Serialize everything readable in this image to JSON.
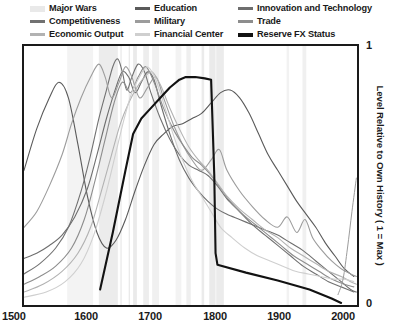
{
  "legend": {
    "items": [
      {
        "label": "Major Wars",
        "color": "#e9e9e9",
        "style": "band",
        "name": "legend-item-major-wars"
      },
      {
        "label": "Education",
        "color": "#5a5a5a",
        "style": "line",
        "name": "legend-item-education"
      },
      {
        "label": "Innovation and Technology",
        "color": "#6e6e6e",
        "style": "line",
        "name": "legend-item-innovation-and-technology"
      },
      {
        "label": "Competitiveness",
        "color": "#717171",
        "style": "line",
        "name": "legend-item-competitiveness"
      },
      {
        "label": "Military",
        "color": "#9c9c9c",
        "style": "line",
        "name": "legend-item-military"
      },
      {
        "label": "Trade",
        "color": "#8d8d8d",
        "style": "line",
        "name": "legend-item-trade"
      },
      {
        "label": "Economic Output",
        "color": "#b2b2b2",
        "style": "line",
        "name": "legend-item-economic-output"
      },
      {
        "label": "Financial Center",
        "color": "#cfcfcf",
        "style": "line",
        "name": "legend-item-financial-center"
      },
      {
        "label": "Reserve FX Status",
        "color": "#121212",
        "style": "thick",
        "name": "legend-item-reserve-fx-status"
      }
    ]
  },
  "axes": {
    "x_ticks": [
      "1500",
      "1600",
      "1700",
      "1800",
      "1900",
      "2000"
    ],
    "y_ticks": {
      "top": "1",
      "bottom": "0"
    },
    "y_title": "Level Relative to Own History ( 1 = Max )"
  },
  "chart_data": {
    "type": "line",
    "title": "",
    "xlabel": "",
    "ylabel": "Level Relative to Own History ( 1 = Max )",
    "xlim": [
      1500,
      2025
    ],
    "ylim": [
      0,
      1
    ],
    "grid": false,
    "legend_position": "top",
    "x_tick_values": [
      1500,
      1600,
      1700,
      1800,
      1900,
      2000
    ],
    "y_tick_values": [
      0,
      1
    ],
    "shaded_bands": {
      "name": "Major Wars",
      "color": "#e9e9e9",
      "intervals": [
        [
          1568,
          1609,
          0.55
        ],
        [
          1618,
          1648,
          0.85
        ],
        [
          1652,
          1654,
          1.0
        ],
        [
          1665,
          1667,
          1.0
        ],
        [
          1672,
          1678,
          0.95
        ],
        [
          1688,
          1697,
          0.8
        ],
        [
          1702,
          1713,
          0.7
        ],
        [
          1739,
          1748,
          0.55
        ],
        [
          1756,
          1763,
          0.75
        ],
        [
          1780,
          1784,
          0.9
        ],
        [
          1792,
          1802,
          0.95
        ],
        [
          1803,
          1815,
          0.9
        ],
        [
          1914,
          1918,
          0.6
        ],
        [
          1939,
          1945,
          0.7
        ]
      ]
    },
    "series": [
      {
        "name": "Major Wars",
        "color": "#e9e9e9",
        "width": 1.0,
        "is_band": true,
        "points": []
      },
      {
        "name": "Education",
        "color": "#5a5a5a",
        "width": 1.1,
        "points": [
          [
            1500,
            0.52
          ],
          [
            1520,
            0.68
          ],
          [
            1540,
            0.8
          ],
          [
            1555,
            0.86
          ],
          [
            1570,
            0.8
          ],
          [
            1585,
            0.62
          ],
          [
            1600,
            0.42
          ],
          [
            1615,
            0.28
          ],
          [
            1630,
            0.22
          ],
          [
            1645,
            0.25
          ],
          [
            1660,
            0.33
          ],
          [
            1675,
            0.44
          ],
          [
            1690,
            0.54
          ],
          [
            1705,
            0.62
          ],
          [
            1720,
            0.66
          ],
          [
            1735,
            0.69
          ],
          [
            1750,
            0.7
          ],
          [
            1765,
            0.72
          ],
          [
            1780,
            0.74
          ],
          [
            1795,
            0.78
          ],
          [
            1810,
            0.82
          ],
          [
            1825,
            0.83
          ],
          [
            1840,
            0.8
          ],
          [
            1855,
            0.74
          ],
          [
            1870,
            0.66
          ],
          [
            1885,
            0.58
          ],
          [
            1900,
            0.52
          ],
          [
            1915,
            0.46
          ],
          [
            1930,
            0.4
          ],
          [
            1945,
            0.35
          ],
          [
            1960,
            0.3
          ],
          [
            1975,
            0.24
          ],
          [
            1990,
            0.19
          ],
          [
            2005,
            0.14
          ],
          [
            2020,
            0.11
          ]
        ]
      },
      {
        "name": "Innovation and Technology",
        "color": "#6e6e6e",
        "width": 1.1,
        "points": [
          [
            1500,
            0.18
          ],
          [
            1520,
            0.2
          ],
          [
            1540,
            0.23
          ],
          [
            1560,
            0.27
          ],
          [
            1580,
            0.34
          ],
          [
            1600,
            0.45
          ],
          [
            1615,
            0.58
          ],
          [
            1630,
            0.72
          ],
          [
            1645,
            0.84
          ],
          [
            1655,
            0.9
          ],
          [
            1665,
            0.88
          ],
          [
            1675,
            0.82
          ],
          [
            1685,
            0.86
          ],
          [
            1695,
            0.9
          ],
          [
            1705,
            0.87
          ],
          [
            1715,
            0.78
          ],
          [
            1730,
            0.66
          ],
          [
            1745,
            0.56
          ],
          [
            1760,
            0.49
          ],
          [
            1775,
            0.44
          ],
          [
            1790,
            0.4
          ],
          [
            1805,
            0.37
          ],
          [
            1820,
            0.35
          ],
          [
            1840,
            0.33
          ],
          [
            1860,
            0.31
          ],
          [
            1880,
            0.29
          ],
          [
            1900,
            0.27
          ],
          [
            1920,
            0.24
          ],
          [
            1940,
            0.21
          ],
          [
            1960,
            0.17
          ],
          [
            1980,
            0.13
          ],
          [
            2000,
            0.09
          ],
          [
            2015,
            0.06
          ],
          [
            2024,
            0.05
          ]
        ]
      },
      {
        "name": "Competitiveness",
        "color": "#717171",
        "width": 1.1,
        "points": [
          [
            1500,
            0.12
          ],
          [
            1525,
            0.16
          ],
          [
            1550,
            0.22
          ],
          [
            1570,
            0.3
          ],
          [
            1590,
            0.44
          ],
          [
            1605,
            0.58
          ],
          [
            1618,
            0.72
          ],
          [
            1630,
            0.83
          ],
          [
            1640,
            0.92
          ],
          [
            1648,
            0.95
          ],
          [
            1655,
            0.9
          ],
          [
            1662,
            0.83
          ],
          [
            1670,
            0.88
          ],
          [
            1680,
            0.93
          ],
          [
            1690,
            0.9
          ],
          [
            1700,
            0.82
          ],
          [
            1715,
            0.72
          ],
          [
            1730,
            0.64
          ],
          [
            1745,
            0.58
          ],
          [
            1760,
            0.54
          ],
          [
            1775,
            0.52
          ],
          [
            1790,
            0.5
          ],
          [
            1805,
            0.46
          ],
          [
            1820,
            0.41
          ],
          [
            1840,
            0.36
          ],
          [
            1860,
            0.31
          ],
          [
            1880,
            0.27
          ],
          [
            1900,
            0.23
          ],
          [
            1920,
            0.19
          ],
          [
            1940,
            0.15
          ],
          [
            1960,
            0.12
          ],
          [
            1980,
            0.09
          ],
          [
            2000,
            0.07
          ],
          [
            2020,
            0.05
          ]
        ]
      },
      {
        "name": "Military",
        "color": "#9c9c9c",
        "width": 1.1,
        "points": [
          [
            1500,
            0.3
          ],
          [
            1520,
            0.36
          ],
          [
            1540,
            0.46
          ],
          [
            1560,
            0.58
          ],
          [
            1575,
            0.7
          ],
          [
            1590,
            0.8
          ],
          [
            1605,
            0.88
          ],
          [
            1618,
            0.93
          ],
          [
            1628,
            0.88
          ],
          [
            1638,
            0.8
          ],
          [
            1650,
            0.86
          ],
          [
            1660,
            0.92
          ],
          [
            1670,
            0.88
          ],
          [
            1682,
            0.8
          ],
          [
            1695,
            0.84
          ],
          [
            1708,
            0.88
          ],
          [
            1720,
            0.8
          ],
          [
            1735,
            0.7
          ],
          [
            1750,
            0.62
          ],
          [
            1765,
            0.56
          ],
          [
            1780,
            0.52
          ],
          [
            1795,
            0.56
          ],
          [
            1808,
            0.6
          ],
          [
            1820,
            0.52
          ],
          [
            1840,
            0.44
          ],
          [
            1860,
            0.38
          ],
          [
            1880,
            0.33
          ],
          [
            1900,
            0.3
          ],
          [
            1915,
            0.34
          ],
          [
            1930,
            0.28
          ],
          [
            1943,
            0.33
          ],
          [
            1955,
            0.26
          ],
          [
            1970,
            0.21
          ],
          [
            1985,
            0.17
          ],
          [
            2000,
            0.14
          ],
          [
            2015,
            0.12
          ],
          [
            2024,
            0.11
          ]
        ]
      },
      {
        "name": "Trade",
        "color": "#8d8d8d",
        "width": 1.1,
        "points": [
          [
            1500,
            0.08
          ],
          [
            1525,
            0.11
          ],
          [
            1550,
            0.15
          ],
          [
            1575,
            0.22
          ],
          [
            1595,
            0.33
          ],
          [
            1612,
            0.48
          ],
          [
            1628,
            0.64
          ],
          [
            1642,
            0.78
          ],
          [
            1655,
            0.86
          ],
          [
            1668,
            0.82
          ],
          [
            1680,
            0.88
          ],
          [
            1692,
            0.92
          ],
          [
            1705,
            0.86
          ],
          [
            1720,
            0.76
          ],
          [
            1735,
            0.68
          ],
          [
            1750,
            0.62
          ],
          [
            1765,
            0.57
          ],
          [
            1780,
            0.54
          ],
          [
            1795,
            0.5
          ],
          [
            1810,
            0.45
          ],
          [
            1825,
            0.4
          ],
          [
            1845,
            0.35
          ],
          [
            1865,
            0.31
          ],
          [
            1885,
            0.27
          ],
          [
            1905,
            0.23
          ],
          [
            1925,
            0.19
          ],
          [
            1945,
            0.16
          ],
          [
            1965,
            0.13
          ],
          [
            1985,
            0.1
          ],
          [
            2005,
            0.08
          ],
          [
            2020,
            0.07
          ]
        ]
      },
      {
        "name": "Economic Output",
        "color": "#b2b2b2",
        "width": 1.1,
        "points": [
          [
            1500,
            0.05
          ],
          [
            1530,
            0.08
          ],
          [
            1560,
            0.13
          ],
          [
            1585,
            0.2
          ],
          [
            1605,
            0.3
          ],
          [
            1622,
            0.44
          ],
          [
            1638,
            0.58
          ],
          [
            1652,
            0.7
          ],
          [
            1665,
            0.78
          ],
          [
            1678,
            0.84
          ],
          [
            1690,
            0.88
          ],
          [
            1702,
            0.9
          ],
          [
            1715,
            0.85
          ],
          [
            1730,
            0.76
          ],
          [
            1745,
            0.68
          ],
          [
            1760,
            0.61
          ],
          [
            1775,
            0.56
          ],
          [
            1790,
            0.52
          ],
          [
            1805,
            0.47
          ],
          [
            1820,
            0.42
          ],
          [
            1840,
            0.37
          ],
          [
            1860,
            0.33
          ],
          [
            1880,
            0.29
          ],
          [
            1900,
            0.26
          ],
          [
            1920,
            0.22
          ],
          [
            1940,
            0.19
          ],
          [
            1960,
            0.16
          ],
          [
            1980,
            0.13
          ],
          [
            2000,
            0.11
          ],
          [
            2015,
            0.09
          ],
          [
            2024,
            0.08
          ]
        ]
      },
      {
        "name": "Financial Center",
        "color": "#cfcfcf",
        "width": 1.1,
        "points": [
          [
            1500,
            0.03
          ],
          [
            1535,
            0.05
          ],
          [
            1565,
            0.09
          ],
          [
            1590,
            0.16
          ],
          [
            1610,
            0.27
          ],
          [
            1628,
            0.42
          ],
          [
            1644,
            0.58
          ],
          [
            1658,
            0.72
          ],
          [
            1670,
            0.82
          ],
          [
            1682,
            0.88
          ],
          [
            1694,
            0.92
          ],
          [
            1706,
            0.88
          ],
          [
            1720,
            0.78
          ],
          [
            1735,
            0.66
          ],
          [
            1750,
            0.56
          ],
          [
            1765,
            0.48
          ],
          [
            1780,
            0.42
          ],
          [
            1795,
            0.36
          ],
          [
            1810,
            0.3
          ],
          [
            1828,
            0.26
          ],
          [
            1848,
            0.22
          ],
          [
            1868,
            0.19
          ],
          [
            1888,
            0.17
          ],
          [
            1908,
            0.15
          ],
          [
            1928,
            0.13
          ],
          [
            1948,
            0.12
          ],
          [
            1968,
            0.11
          ],
          [
            1988,
            0.1
          ],
          [
            2005,
            0.1
          ],
          [
            2020,
            0.09
          ]
        ]
      },
      {
        "name": "Reserve FX Status",
        "color": "#121212",
        "width": 2.1,
        "points": [
          [
            1620,
            0.06
          ],
          [
            1640,
            0.28
          ],
          [
            1660,
            0.52
          ],
          [
            1672,
            0.66
          ],
          [
            1685,
            0.72
          ],
          [
            1700,
            0.76
          ],
          [
            1715,
            0.8
          ],
          [
            1730,
            0.84
          ],
          [
            1745,
            0.87
          ],
          [
            1755,
            0.88
          ],
          [
            1770,
            0.88
          ],
          [
            1785,
            0.875
          ],
          [
            1795,
            0.87
          ],
          [
            1800,
            0.5
          ],
          [
            1802,
            0.2
          ],
          [
            1805,
            0.155
          ],
          [
            1850,
            0.125
          ],
          [
            1900,
            0.095
          ],
          [
            1950,
            0.06
          ],
          [
            1985,
            0.025
          ],
          [
            2000,
            0.008
          ]
        ]
      },
      {
        "name": "Late Rising Line",
        "color": "#9c9c9c",
        "width": 1.0,
        "points": [
          [
            1995,
            0.04
          ],
          [
            2003,
            0.1
          ],
          [
            2010,
            0.22
          ],
          [
            2017,
            0.36
          ],
          [
            2024,
            0.49
          ]
        ]
      }
    ]
  }
}
